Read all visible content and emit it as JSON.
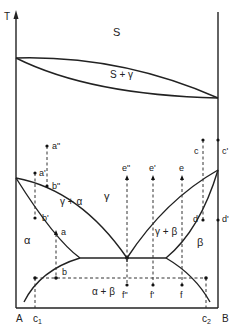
{
  "diagram": {
    "axes": {
      "y_label": "T",
      "left_component": "A",
      "right_component": "B",
      "composition_marks": [
        "c1",
        "c2"
      ]
    },
    "phase_labels": {
      "liquid": "S",
      "liquid_gamma": "S + γ",
      "gamma": "γ",
      "gamma_alpha": "γ + α",
      "gamma_beta": "γ + β",
      "alpha": "α",
      "beta": "β",
      "alpha_beta": "α + β"
    },
    "point_labels": {
      "a2": "a\"",
      "a1": "a'",
      "a": "a",
      "b2": "b\"",
      "b1": "b'",
      "b": "b",
      "c": "c",
      "c1p": "c'",
      "d": "d",
      "d1": "d'",
      "e2": "e\"",
      "e1": "e'",
      "e": "e",
      "f2": "f\"",
      "f1": "f'",
      "f": "f"
    },
    "c1_label": "c",
    "c1_sub": "1",
    "c2_label": "c",
    "c2_sub": "2"
  }
}
